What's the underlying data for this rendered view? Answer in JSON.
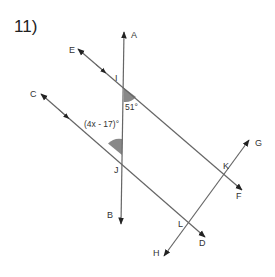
{
  "problem": {
    "number": "11)"
  },
  "points": {
    "A": "A",
    "B": "B",
    "C": "C",
    "D": "D",
    "E": "E",
    "F": "F",
    "G": "G",
    "H": "H",
    "I": "I",
    "J": "J",
    "K": "K",
    "L": "L"
  },
  "angles": {
    "at_I": "51°",
    "at_J": "(4x - 17)°"
  },
  "colors": {
    "line": "#666666",
    "angle_fill": "#888888",
    "text": "#333333"
  }
}
